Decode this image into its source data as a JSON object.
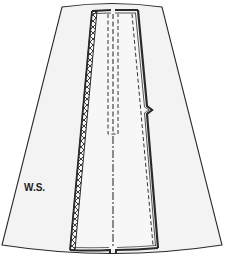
{
  "diagram": {
    "type": "sewing-pattern",
    "labels": {
      "side": "W.S."
    },
    "colors": {
      "background": "#ffffff",
      "fabric": "#f3f3f3",
      "line": "#2a2a2a",
      "stitch": "#333333"
    },
    "elements": [
      {
        "id": "skirt-outline",
        "description": "A-line skirt piece outline"
      },
      {
        "id": "left-pleat-edge",
        "description": "Zigzag-finished (overcast) left pleat edge"
      },
      {
        "id": "right-pleat-edge",
        "description": "Double-line folded right pleat edge"
      },
      {
        "id": "center-seam",
        "description": "Center seam line (dash-dot)"
      },
      {
        "id": "zipper-stitching",
        "description": "Dashed zipper stitching box at top center"
      },
      {
        "id": "pleat-stitching",
        "description": "Dashed stitching line along right pleat"
      },
      {
        "id": "notch",
        "description": "Notch marking on right pleat edge"
      },
      {
        "id": "hem",
        "description": "Curved hem with split at center"
      }
    ]
  }
}
